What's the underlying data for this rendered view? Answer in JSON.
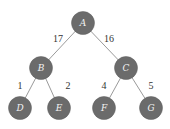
{
  "tree": {
    "node_color": "#6b6b6b",
    "edge_color": "#9a9a9a",
    "nodes": [
      {
        "id": "A",
        "label": "A",
        "x": 83,
        "y": 23
      },
      {
        "id": "B",
        "label": "B",
        "x": 41,
        "y": 68
      },
      {
        "id": "C",
        "label": "C",
        "x": 126,
        "y": 68
      },
      {
        "id": "D",
        "label": "D",
        "x": 20,
        "y": 108
      },
      {
        "id": "E",
        "label": "E",
        "x": 59,
        "y": 108
      },
      {
        "id": "F",
        "label": "F",
        "x": 104,
        "y": 108
      },
      {
        "id": "G",
        "label": "G",
        "x": 151,
        "y": 108
      }
    ],
    "edges": [
      {
        "from": "A",
        "to": "B",
        "weight": "17",
        "lx": 58,
        "ly": 38
      },
      {
        "from": "A",
        "to": "C",
        "weight": "16",
        "lx": 109,
        "ly": 38
      },
      {
        "from": "B",
        "to": "D",
        "weight": "1",
        "lx": 20,
        "ly": 85
      },
      {
        "from": "B",
        "to": "E",
        "weight": "2",
        "lx": 68,
        "ly": 85
      },
      {
        "from": "C",
        "to": "F",
        "weight": "4",
        "lx": 104,
        "ly": 85
      },
      {
        "from": "C",
        "to": "G",
        "weight": "5",
        "lx": 151,
        "ly": 85
      }
    ]
  }
}
